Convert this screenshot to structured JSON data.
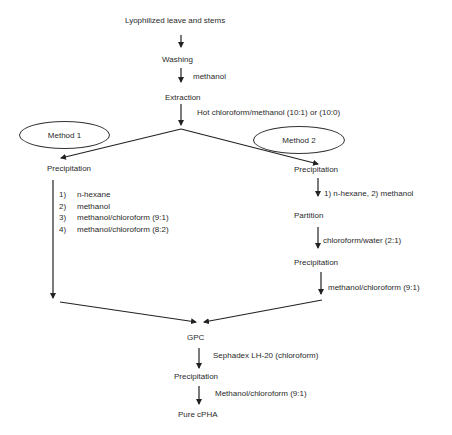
{
  "diagram": {
    "top_chain": {
      "start": "Lyophilized leave and stems",
      "washing": "Washing",
      "washing_solvent": "methanol",
      "extraction": "Extraction",
      "extraction_solvent": "Hot chloroform/methanol (10:1) or (10:0)"
    },
    "method1": {
      "label": "Method 1",
      "precipitation": "Precipitation",
      "steps": [
        {
          "num": "1)",
          "text": "n-hexane"
        },
        {
          "num": "2)",
          "text": "methanol"
        },
        {
          "num": "3)",
          "text": "methanol/chloroform (9:1)"
        },
        {
          "num": "4)",
          "text": "methanol/chloroform (8:2)"
        }
      ]
    },
    "method2": {
      "label": "Method 2",
      "precipitation1": "Precipitation",
      "precipitation1_solvent": "1) n-hexane, 2) methanol",
      "partition": "Partition",
      "partition_solvent": "chloroform/water (2:1)",
      "precipitation2": "Precipitation",
      "precipitation2_solvent": "methanol/chloroform (9:1)"
    },
    "bottom_chain": {
      "gpc": "GPC",
      "gpc_medium": "Sephadex LH-20 (chloroform)",
      "precipitation": "Precipitation",
      "precipitation_solvent": "Methanol/chloroform (9:1)",
      "final": "Pure cPHA"
    },
    "colors": {
      "line": "#222222",
      "text": "#2a2a2a",
      "background": "#ffffff"
    }
  }
}
